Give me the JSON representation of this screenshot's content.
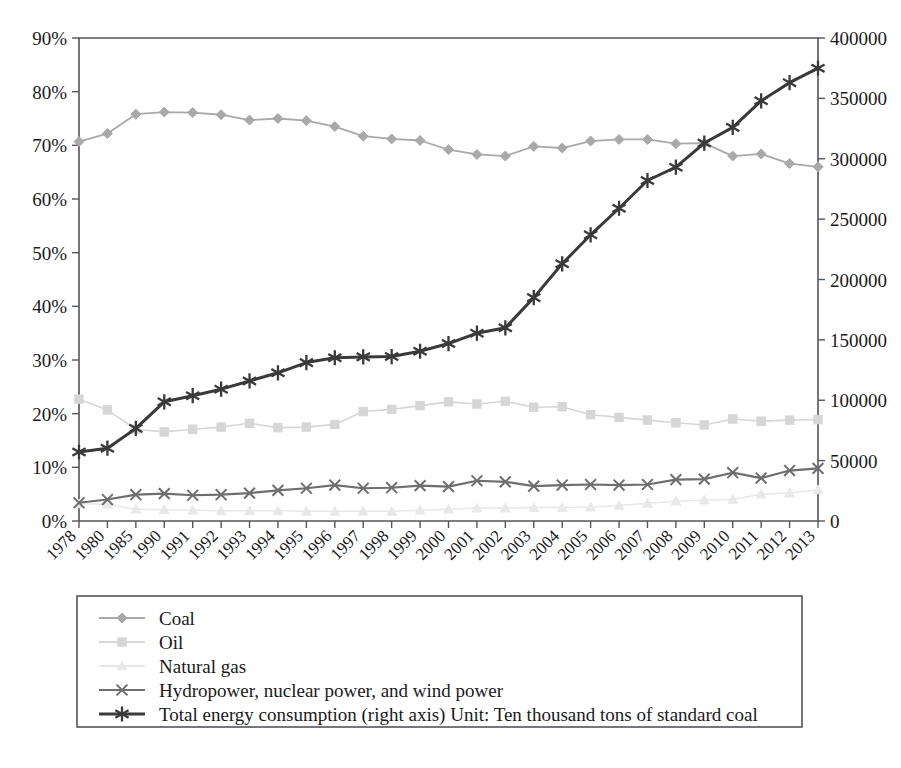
{
  "chart_data": {
    "type": "line",
    "title": "",
    "subtitle": "",
    "xlabel": "",
    "ylabel": "",
    "grid": false,
    "legend_position": "bottom",
    "categories": [
      "1978",
      "1980",
      "1985",
      "1990",
      "1991",
      "1992",
      "1993",
      "1994",
      "1995",
      "1996",
      "1997",
      "1998",
      "1999",
      "2000",
      "2001",
      "2002",
      "2003",
      "2004",
      "2005",
      "2006",
      "2007",
      "2008",
      "2009",
      "2010",
      "2011",
      "2012",
      "2013"
    ],
    "axes": {
      "left": {
        "label": "",
        "ylim": [
          0,
          90
        ],
        "unit": "%",
        "ticks": [
          "0%",
          "10%",
          "20%",
          "30%",
          "40%",
          "50%",
          "60%",
          "70%",
          "80%",
          "90%"
        ],
        "tick_values": [
          0,
          10,
          20,
          30,
          40,
          50,
          60,
          70,
          80,
          90
        ]
      },
      "right": {
        "label": "",
        "ylim": [
          0,
          400000
        ],
        "unit": "Ten thousand tons of standard coal",
        "ticks": [
          "0",
          "50000",
          "100000",
          "150000",
          "200000",
          "250000",
          "300000",
          "350000",
          "400000"
        ],
        "tick_values": [
          0,
          50000,
          100000,
          150000,
          200000,
          250000,
          300000,
          350000,
          400000
        ]
      }
    },
    "series": [
      {
        "name": "Coal",
        "axis": "left",
        "marker": "diamond",
        "color": "#a9a9a9",
        "values": [
          70.7,
          72.2,
          75.8,
          76.2,
          76.1,
          75.7,
          74.7,
          75.0,
          74.6,
          73.5,
          71.7,
          71.2,
          70.9,
          69.2,
          68.3,
          68.0,
          69.8,
          69.5,
          70.8,
          71.1,
          71.1,
          70.3,
          70.4,
          68.0,
          68.4,
          66.6,
          66.0
        ],
        "value_unit": "%"
      },
      {
        "name": "Oil",
        "axis": "left",
        "marker": "square",
        "color": "#d6d6d6",
        "values": [
          22.7,
          20.7,
          17.1,
          16.6,
          17.1,
          17.5,
          18.2,
          17.4,
          17.5,
          18.0,
          20.4,
          20.8,
          21.5,
          22.2,
          21.8,
          22.3,
          21.2,
          21.3,
          19.8,
          19.3,
          18.8,
          18.3,
          17.9,
          19.0,
          18.6,
          18.8,
          18.9
        ],
        "value_unit": "%"
      },
      {
        "name": "Natural gas",
        "axis": "left",
        "marker": "triangle",
        "color": "#e8e8e8",
        "values": [
          3.2,
          3.1,
          2.2,
          2.1,
          2.0,
          1.9,
          1.9,
          1.9,
          1.8,
          1.8,
          1.8,
          1.8,
          2.0,
          2.2,
          2.4,
          2.4,
          2.5,
          2.5,
          2.6,
          2.9,
          3.3,
          3.7,
          3.9,
          4.0,
          5.0,
          5.2,
          5.8
        ],
        "value_unit": "%"
      },
      {
        "name": "Hydropower, nuclear power, and wind power",
        "axis": "left",
        "marker": "x",
        "color": "#6e6e6e",
        "values": [
          3.4,
          4.0,
          4.9,
          5.1,
          4.8,
          4.9,
          5.2,
          5.7,
          6.1,
          6.7,
          6.1,
          6.2,
          6.6,
          6.4,
          7.5,
          7.3,
          6.5,
          6.7,
          6.8,
          6.7,
          6.8,
          7.7,
          7.8,
          9.0,
          8.0,
          9.4,
          9.8
        ],
        "value_unit": "%"
      },
      {
        "name": "Total energy consumption (right axis) Unit: Ten thousand tons of standard coal",
        "axis": "right",
        "marker": "star",
        "color": "#3a3a3a",
        "values": [
          57144,
          60275,
          76682,
          98703,
          103783,
          109170,
          115993,
          122737,
          131176,
          135192,
          135909,
          136184,
          140569,
          146964,
          155547,
          169577,
          197083,
          230281,
          261369,
          286467,
          311442,
          320611,
          336126,
          360648,
          387043,
          402138,
          416913
        ],
        "value_unit": "Ten thousand tons of standard coal",
        "plotted_values": [
          57144,
          60275,
          76682,
          98703,
          103783,
          109170,
          115993,
          122737,
          131176,
          135192,
          135909,
          136184,
          140569,
          146964,
          155547,
          160000,
          185000,
          213000,
          237000,
          259000,
          282000,
          293000,
          313000,
          326000,
          348000,
          363000,
          375000
        ]
      }
    ],
    "legend": [
      {
        "label": "Coal",
        "marker": "diamond",
        "color": "#a9a9a9"
      },
      {
        "label": "Oil",
        "marker": "square",
        "color": "#d6d6d6"
      },
      {
        "label": "Natural gas",
        "marker": "triangle",
        "color": "#e8e8e8"
      },
      {
        "label": "Hydropower, nuclear power, and wind power",
        "marker": "x",
        "color": "#6e6e6e"
      },
      {
        "label": "Total energy consumption (right axis) Unit: Ten thousand tons of standard coal",
        "marker": "star",
        "color": "#3a3a3a"
      }
    ]
  }
}
